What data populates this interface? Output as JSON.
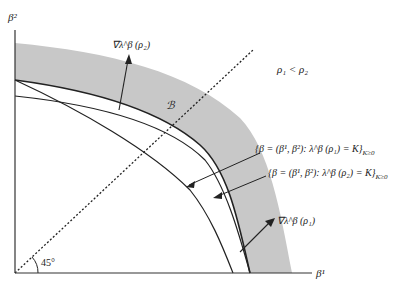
{
  "diagram": {
    "axes": {
      "x_label": "β¹",
      "y_label": "β²",
      "angle_label": "45°"
    },
    "region_label": "ℬ",
    "inequality": "ρ₁ < ρ₂",
    "gradients": {
      "rho2": "∇λ^β (ρ₂)",
      "rho1": "∇λ^β (ρ₁)"
    },
    "level_sets": {
      "rho1": "{β = (β¹, β²): λ^β (ρ₁) = K}",
      "rho1_sub": "K≥0",
      "rho2": "{β = (β¹, β²): λ^β (ρ₂) = K}",
      "rho2_sub": "K≥0"
    },
    "colors": {
      "band": "#c8c8c8",
      "line": "#222222"
    }
  }
}
